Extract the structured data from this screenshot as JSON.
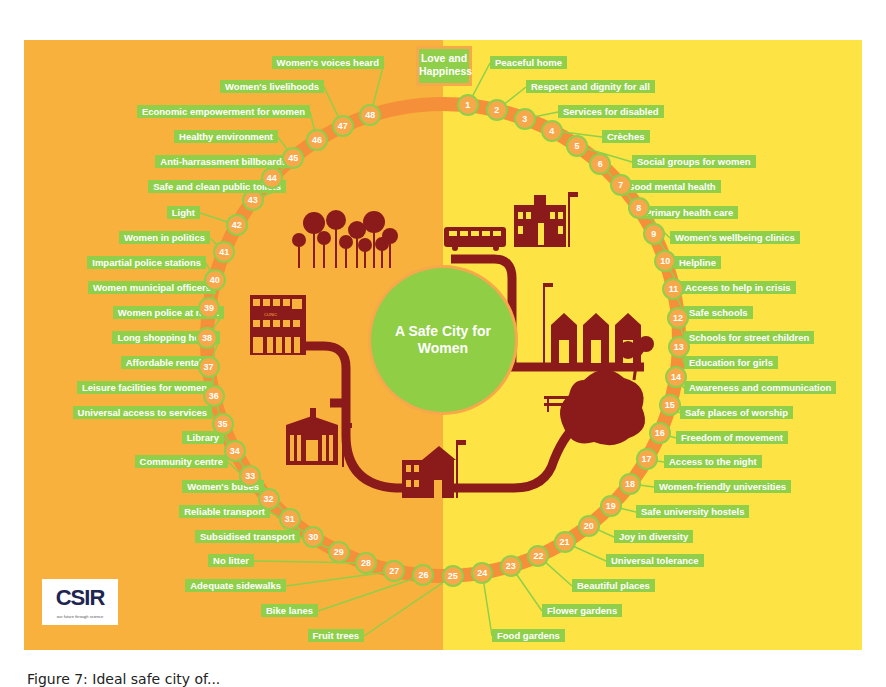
{
  "poster": {
    "title_box": "Love and Happiness",
    "center_title": "A Safe City for Women",
    "logo": {
      "text": "CSIR",
      "tagline": "our future through science"
    },
    "colors": {
      "left_bg": "#f8b13d",
      "right_bg": "#fde444",
      "label_green": "#8fcf4a",
      "ring_orange": "#f58f3a",
      "node_orange": "#f7a84a",
      "icon_maroon": "#8b1a1a",
      "center_green": "#8fce45"
    },
    "items": [
      {
        "n": 1,
        "label": "Peaceful home"
      },
      {
        "n": 2,
        "label": "Respect and dignity for all"
      },
      {
        "n": 3,
        "label": "Services for disabled"
      },
      {
        "n": 4,
        "label": "Crèches"
      },
      {
        "n": 5,
        "label": "Social groups for women"
      },
      {
        "n": 6,
        "label": "Good mental health"
      },
      {
        "n": 7,
        "label": "Primary health care"
      },
      {
        "n": 8,
        "label": "Women's wellbeing clinics"
      },
      {
        "n": 9,
        "label": "Helpline"
      },
      {
        "n": 10,
        "label": "Access to help in crisis"
      },
      {
        "n": 11,
        "label": "Safe schools"
      },
      {
        "n": 12,
        "label": "Schools for street children"
      },
      {
        "n": 13,
        "label": "Education for girls"
      },
      {
        "n": 14,
        "label": "Awareness and communication"
      },
      {
        "n": 15,
        "label": "Safe places of worship"
      },
      {
        "n": 16,
        "label": "Freedom of movement"
      },
      {
        "n": 17,
        "label": "Access to the night"
      },
      {
        "n": 18,
        "label": "Women-friendly universities"
      },
      {
        "n": 19,
        "label": "Safe university hostels"
      },
      {
        "n": 20,
        "label": "Joy in diversity"
      },
      {
        "n": 21,
        "label": "Universal tolerance"
      },
      {
        "n": 22,
        "label": "Beautiful places"
      },
      {
        "n": 23,
        "label": "Flower gardens"
      },
      {
        "n": 24,
        "label": "Food gardens"
      },
      {
        "n": 25,
        "label": "Fruit trees"
      },
      {
        "n": 26,
        "label": "Bike lanes"
      },
      {
        "n": 27,
        "label": "Adequate sidewalks"
      },
      {
        "n": 28,
        "label": "No litter"
      },
      {
        "n": 29,
        "label": "Subsidised transport"
      },
      {
        "n": 30,
        "label": "Reliable transport"
      },
      {
        "n": 31,
        "label": "Women's buses"
      },
      {
        "n": 32,
        "label": "Community centre"
      },
      {
        "n": 33,
        "label": "Library"
      },
      {
        "n": 34,
        "label": "Universal access to services"
      },
      {
        "n": 35,
        "label": "Leisure facilities for women"
      },
      {
        "n": 36,
        "label": "Affordable rentals"
      },
      {
        "n": 37,
        "label": "Long shopping hours"
      },
      {
        "n": 38,
        "label": "Women police at night"
      },
      {
        "n": 39,
        "label": "Women municipal officers"
      },
      {
        "n": 40,
        "label": "Impartial police stations"
      },
      {
        "n": 41,
        "label": "Women in politics"
      },
      {
        "n": 42,
        "label": "Light"
      },
      {
        "n": 43,
        "label": "Safe and clean public toilets"
      },
      {
        "n": 44,
        "label": "Anti-harrassment billboards"
      },
      {
        "n": 45,
        "label": "Healthy environment"
      },
      {
        "n": 46,
        "label": "Economic empowerment for women"
      },
      {
        "n": 47,
        "label": "Women's livelihoods"
      },
      {
        "n": 48,
        "label": "Women's voices heard"
      }
    ],
    "icons": [
      "forest-icon",
      "clinic-icon",
      "court-icon",
      "police-station-icon",
      "bus-icon",
      "school-icon",
      "houses-icon",
      "street-lamp-icon",
      "bench-icon",
      "park-tree-icon",
      "road-icon"
    ],
    "icon_labels": {
      "clinic": "CLINIC",
      "court": "COURT",
      "police": "SAPS"
    }
  },
  "caption": "Figure 7: Ideal safe city of..."
}
